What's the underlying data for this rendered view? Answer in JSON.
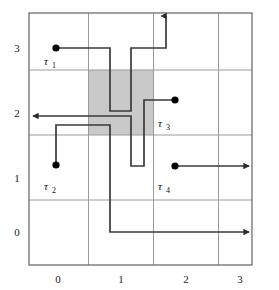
{
  "figure": {
    "title": "",
    "type": "grid-trajectory-diagram",
    "grid": {
      "x_ticks": [
        "0",
        "1",
        "2",
        "3"
      ],
      "y_ticks": [
        "3",
        "2",
        "1",
        "0"
      ],
      "columns": 4,
      "rows": 4,
      "border_color": "#6e6e6e",
      "gridline_color": "#9a9a9a",
      "background_color": "#ffffff"
    },
    "obstacle": {
      "name": "shaded-cell",
      "fill_color": "#c9c9c9",
      "cell_x": 1,
      "cell_y": 2
    },
    "trajectories": [
      {
        "id": "tau-1",
        "label": "τ",
        "subscript": "1",
        "start": [
          0,
          3
        ],
        "end_marker": "arrow-up",
        "color": "#3a3a3a"
      },
      {
        "id": "tau-2",
        "label": "τ",
        "subscript": "2",
        "start": [
          0,
          1
        ],
        "end_marker": "arrow-right",
        "color": "#3a3a3a"
      },
      {
        "id": "tau-3",
        "label": "τ",
        "subscript": "3",
        "start": [
          2,
          2
        ],
        "end_marker": "arrow-left",
        "color": "#3a3a3a"
      },
      {
        "id": "tau-4",
        "label": "τ",
        "subscript": "4",
        "start": [
          2,
          1
        ],
        "end_marker": "arrow-right",
        "color": "#3a3a3a"
      }
    ],
    "marker": {
      "shape": "filled-circle",
      "color": "#000000",
      "radius": 3.6
    }
  }
}
